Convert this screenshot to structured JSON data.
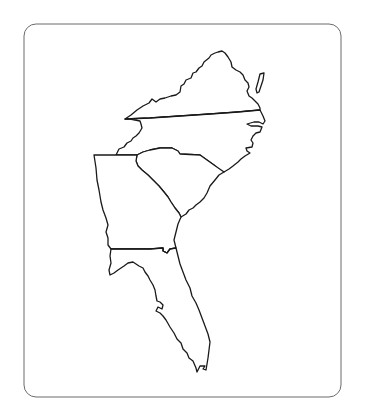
{
  "map": {
    "title": "Southeastern United States outline map",
    "states": [
      {
        "id": "VA",
        "name": "Virginia"
      },
      {
        "id": "NC",
        "name": "North Carolina"
      },
      {
        "id": "SC",
        "name": "South Carolina"
      },
      {
        "id": "GA",
        "name": "Georgia"
      },
      {
        "id": "FL",
        "name": "Florida"
      }
    ],
    "colors": {
      "outline": "#1a1a1a",
      "frame": "#6b6b6b",
      "fill": "#ffffff",
      "background": "#ffffff"
    },
    "labels_visible": false
  }
}
